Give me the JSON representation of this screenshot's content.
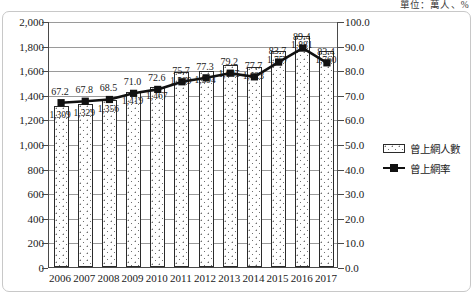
{
  "unit_caption": "單位：萬人、%",
  "legend": {
    "items": [
      {
        "name": "bars",
        "label": "曾上網人數",
        "marker": "dotted-bar-swatch"
      },
      {
        "name": "line",
        "label": "曾上網率",
        "marker": "line-square-marker"
      }
    ]
  },
  "axes": {
    "left": {
      "ticks": [
        "0",
        "200",
        "400",
        "600",
        "800",
        "1,000",
        "1,200",
        "1,400",
        "1,600",
        "1,800",
        "2,000"
      ],
      "min": 0,
      "max": 2000,
      "step": 200
    },
    "right": {
      "ticks": [
        "0.0",
        "10.0",
        "20.0",
        "30.0",
        "40.0",
        "50.0",
        "60.0",
        "70.0",
        "80.0",
        "90.0",
        "100.0"
      ],
      "min": 0,
      "max": 100,
      "step": 10
    }
  },
  "chart_data": {
    "type": "bar",
    "title": "",
    "subtitle": "",
    "xlabel": "",
    "ylabel": "",
    "categories": [
      "2006",
      "2007",
      "2008",
      "2009",
      "2010",
      "2011",
      "2012",
      "2013",
      "2014",
      "2015",
      "2016",
      "2017"
    ],
    "series": [
      {
        "name": "曾上網人數",
        "type": "bar",
        "axis": "left",
        "unit": "萬人",
        "values": [
          1309,
          1329,
          1356,
          1419,
          1467,
          1589,
          1594,
          1645,
          1623,
          1757,
          1881,
          1760
        ],
        "labels": [
          "1,309",
          "1,329",
          "1,356",
          "1,419",
          "1,467",
          "1,589",
          "1,594",
          "1,645",
          "1,623",
          "1,757",
          "1,881",
          "1,760"
        ]
      },
      {
        "name": "曾上網率",
        "type": "line",
        "axis": "right",
        "unit": "%",
        "values": [
          67.2,
          67.8,
          68.5,
          71.0,
          72.6,
          75.7,
          77.3,
          79.2,
          77.7,
          83.7,
          89.4,
          83.4
        ],
        "labels": [
          "67.2",
          "67.8",
          "68.5",
          "71.0",
          "72.6",
          "75.7",
          "77.3",
          "79.2",
          "77.7",
          "83.7",
          "89.4",
          "83.4"
        ]
      }
    ],
    "ylim": [
      0,
      2000
    ],
    "y2lim": [
      0,
      100
    ],
    "grid": true,
    "legend_position": "right"
  },
  "colors": {
    "line": "#111111",
    "bar_outline": "#2b2b2b",
    "bar_fill": "#ffffff",
    "grid": "#9a9a9a",
    "axis": "#4a4a4a",
    "frame": "#c8c8c8",
    "text": "#1a1a1a"
  }
}
